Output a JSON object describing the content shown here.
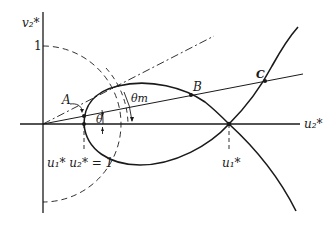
{
  "diagram": {
    "type": "phase-plane construction",
    "axes": {
      "vertical_label": "v₂*",
      "horizontal_label": "u₂*",
      "vertical_tick_label": "1"
    },
    "labels": {
      "point_a": "A",
      "point_b": "B",
      "point_c": "C",
      "angle_theta": "θ",
      "angle_theta_m": "θm",
      "hyperbola_eq": "u₁* u₂* = 1",
      "u1_star": "u₁*"
    },
    "colors": {
      "ink": "#1a1a1a",
      "background": "#ffffff"
    }
  }
}
